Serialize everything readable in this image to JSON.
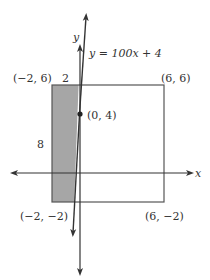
{
  "diagram": {
    "type": "coordinate-plane",
    "line_equation": "y = 100x + 4",
    "axis_labels": {
      "x": "x",
      "y": "y"
    },
    "rectangle": {
      "corners": {
        "top_left": "(−2, 6)",
        "top_right": "(6, 6)",
        "bottom_left": "(−2, −2)",
        "bottom_right": "(6, −2)"
      },
      "width_label": "2",
      "height_label": "8"
    },
    "point": {
      "label": "(0, 4)"
    },
    "colors": {
      "shaded_region": "#a6a6a6",
      "lines": "#333333",
      "rect_border": "#555555"
    }
  }
}
